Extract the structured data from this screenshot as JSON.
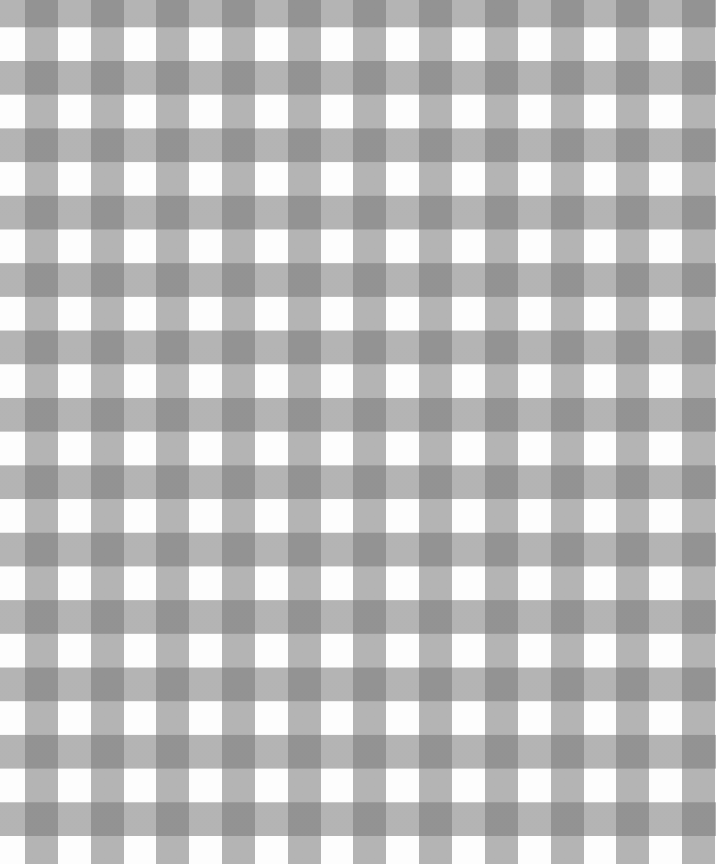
{
  "pattern": {
    "name": "gingham check",
    "colors": {
      "white": "#fdfdfd",
      "light_gray": "#b4b4b4",
      "dark_gray": "#5f5f5f"
    },
    "column_period_px": 65.7,
    "row_period_px": 67.4,
    "band_width_px": 33
  }
}
